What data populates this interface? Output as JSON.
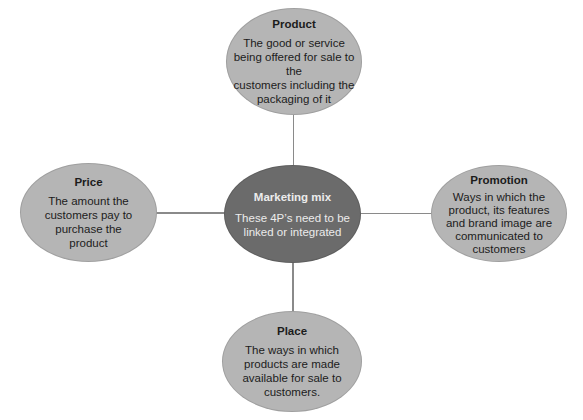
{
  "diagram": {
    "center": {
      "title": "Marketing mix",
      "description_lines": [
        "These 4P’s need to be",
        "linked or integrated"
      ]
    },
    "nodes": {
      "product": {
        "title": "Product",
        "description_lines": [
          "The good or service",
          "being offered for sale to the",
          "customers including the",
          "packaging of it"
        ]
      },
      "price": {
        "title": "Price",
        "description_lines": [
          "The amount the",
          "customers pay to",
          "purchase the",
          "product"
        ]
      },
      "promotion": {
        "title": "Promotion",
        "description_lines": [
          "Ways in which the",
          "product, its features",
          "and brand image are",
          "communicated to",
          "customers"
        ]
      },
      "place": {
        "title": "Place",
        "description_lines": [
          "The ways in which",
          "products are made",
          "available for sale to",
          "customers."
        ]
      }
    },
    "colors": {
      "outer_fill": "#b5b5b5",
      "center_fill": "#6b6b6b",
      "connector": "#8a8a8a",
      "outer_text": "#1c1c1c",
      "center_text": "#ececec"
    }
  }
}
